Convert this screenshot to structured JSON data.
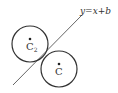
{
  "diagram": {
    "line": {
      "label": "y=x+b",
      "x1": 13,
      "y1": 85,
      "x2": 82,
      "y2": 15
    },
    "circles": [
      {
        "name": "C2",
        "label_main": "C",
        "label_sub": "2",
        "cx": 30,
        "cy": 44,
        "r": 18
      },
      {
        "name": "C",
        "label_main": "C",
        "label_sub": "",
        "cx": 59,
        "cy": 69,
        "r": 18
      }
    ],
    "colors": {
      "stroke": "#333333",
      "line": "#555555",
      "background": "#ffffff"
    }
  }
}
